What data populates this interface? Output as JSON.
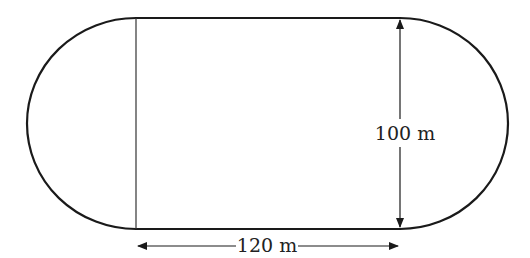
{
  "diagram": {
    "type": "running-track",
    "shape": "rectangle with two semicircular ends",
    "labels": {
      "height": "100 m",
      "width": "120 m"
    },
    "colors": {
      "stroke": "#1a1a1a",
      "text": "#222222",
      "background": "#ffffff"
    }
  }
}
